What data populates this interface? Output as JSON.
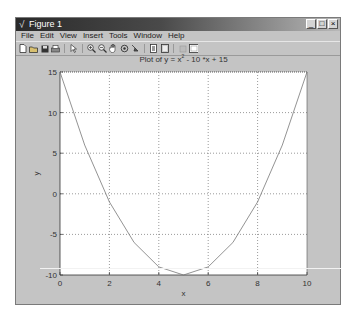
{
  "window": {
    "title": "Figure 1",
    "controls": [
      "_",
      "□",
      "×"
    ]
  },
  "menubar": {
    "items": [
      "File",
      "Edit",
      "View",
      "Insert",
      "Tools",
      "Window",
      "Help"
    ]
  },
  "toolbar": {
    "icons": [
      "new-figure",
      "open-file",
      "save",
      "print",
      "edit-plot",
      "zoom-in",
      "zoom-out",
      "pan",
      "rotate-3d",
      "data-cursor",
      "insert-colorbar",
      "insert-legend",
      "hide-plot-tools",
      "show-plot-tools"
    ]
  },
  "plot": {
    "title_prefix": "Plot of y = x",
    "title_sup": "2",
    "title_suffix": " - 10 *x + 15"
  },
  "chart_data": {
    "type": "line",
    "xlabel": "x",
    "ylabel": "y",
    "x": [
      0,
      1,
      2,
      3,
      4,
      5,
      6,
      7,
      8,
      9,
      10
    ],
    "series": [
      {
        "name": "y = x^2 - 10x + 15",
        "values": [
          15,
          6,
          -1,
          -6,
          -9,
          -10,
          -9,
          -6,
          -1,
          6,
          15
        ],
        "color": "#777777"
      }
    ],
    "xlim": [
      0,
      10
    ],
    "ylim": [
      -10,
      15
    ],
    "xticks": [
      0,
      2,
      4,
      6,
      8,
      10
    ],
    "yticks": [
      -10,
      -5,
      0,
      5,
      10,
      15
    ],
    "grid": true
  }
}
